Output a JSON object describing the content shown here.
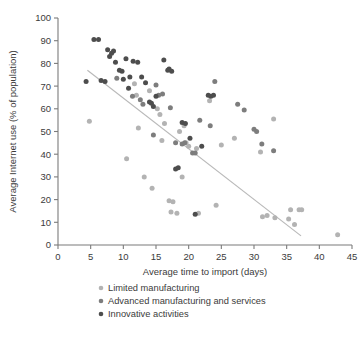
{
  "chart_data": {
    "type": "scatter",
    "title": "",
    "xlabel": "Average time to import (days)",
    "ylabel": "Average Internet use (% of population)",
    "xlim": [
      0,
      45
    ],
    "ylim": [
      0,
      100
    ],
    "xticks": [
      0,
      5,
      10,
      15,
      20,
      25,
      30,
      35,
      40,
      45
    ],
    "yticks": [
      0,
      10,
      20,
      30,
      40,
      50,
      60,
      70,
      80,
      90,
      100
    ],
    "grid": false,
    "legend_position": "below",
    "colors": {
      "limited_manufacturing": "#b3b3b3",
      "advanced_manufacturing": "#7d7d7d",
      "innovative_activities": "#4d4d4d",
      "trend_line": "#b9b9b9",
      "axis": "#7b7b7b",
      "text": "#3b3b3b"
    },
    "trend_line": {
      "x": [
        4.5,
        37.2
      ],
      "y": [
        77.0,
        4.0
      ]
    },
    "series": [
      {
        "name": "Limited manufacturing",
        "color": "#b3b3b3",
        "points": [
          [
            4.8,
            54.5
          ],
          [
            10.5,
            38.0
          ],
          [
            11.7,
            71.0
          ],
          [
            12.0,
            66.0
          ],
          [
            12.3,
            51.5
          ],
          [
            13.2,
            30.0
          ],
          [
            14.0,
            68.0
          ],
          [
            14.4,
            25.0
          ],
          [
            15.2,
            60.0
          ],
          [
            15.6,
            57.5
          ],
          [
            15.9,
            46.0
          ],
          [
            16.3,
            53.5
          ],
          [
            17.0,
            19.5
          ],
          [
            17.3,
            14.5
          ],
          [
            17.6,
            19.0
          ],
          [
            18.2,
            14.0
          ],
          [
            18.6,
            50.0
          ],
          [
            19.0,
            30.0
          ],
          [
            19.3,
            52.5
          ],
          [
            19.6,
            45.0
          ],
          [
            20.0,
            43.5
          ],
          [
            21.2,
            42.5
          ],
          [
            21.5,
            14.0
          ],
          [
            23.2,
            63.5
          ],
          [
            24.2,
            17.5
          ],
          [
            25.0,
            44.0
          ],
          [
            27.0,
            47.0
          ],
          [
            31.0,
            41.0
          ],
          [
            31.3,
            12.5
          ],
          [
            32.0,
            13.0
          ],
          [
            33.0,
            55.5
          ],
          [
            33.2,
            12.0
          ],
          [
            35.3,
            11.5
          ],
          [
            35.6,
            15.5
          ],
          [
            36.2,
            9.0
          ],
          [
            36.9,
            15.5
          ],
          [
            37.3,
            15.5
          ],
          [
            42.8,
            4.5
          ]
        ]
      },
      {
        "name": "Advanced manufacturing and services",
        "color": "#7d7d7d",
        "points": [
          [
            9.0,
            73.5
          ],
          [
            11.4,
            65.5
          ],
          [
            12.6,
            64.0
          ],
          [
            13.0,
            62.0
          ],
          [
            14.6,
            48.5
          ],
          [
            15.0,
            70.5
          ],
          [
            15.4,
            66.0
          ],
          [
            16.0,
            66.5
          ],
          [
            17.2,
            60.5
          ],
          [
            18.0,
            45.0
          ],
          [
            19.0,
            44.5
          ],
          [
            19.4,
            45.0
          ],
          [
            20.6,
            40.5
          ],
          [
            21.0,
            40.5
          ],
          [
            21.7,
            55.0
          ],
          [
            23.3,
            52.5
          ],
          [
            24.0,
            72.0
          ],
          [
            27.5,
            62.0
          ],
          [
            28.5,
            59.5
          ],
          [
            30.0,
            51.0
          ],
          [
            30.4,
            50.0
          ],
          [
            31.2,
            44.5
          ],
          [
            33.0,
            41.5
          ]
        ]
      },
      {
        "name": "Innovative activities",
        "color": "#4d4d4d",
        "points": [
          [
            4.3,
            72.0
          ],
          [
            5.5,
            90.5
          ],
          [
            6.2,
            90.5
          ],
          [
            6.6,
            72.5
          ],
          [
            7.2,
            72.0
          ],
          [
            7.6,
            86.0
          ],
          [
            7.9,
            83.0
          ],
          [
            8.2,
            84.5
          ],
          [
            8.5,
            85.5
          ],
          [
            8.8,
            80.5
          ],
          [
            9.4,
            77.0
          ],
          [
            9.8,
            76.5
          ],
          [
            10.0,
            73.0
          ],
          [
            10.4,
            82.0
          ],
          [
            10.8,
            69.0
          ],
          [
            11.0,
            74.0
          ],
          [
            11.5,
            81.0
          ],
          [
            12.2,
            80.5
          ],
          [
            12.8,
            74.0
          ],
          [
            13.4,
            71.5
          ],
          [
            14.0,
            63.0
          ],
          [
            14.3,
            62.5
          ],
          [
            14.6,
            61.0
          ],
          [
            15.0,
            65.5
          ],
          [
            16.2,
            81.5
          ],
          [
            16.8,
            77.0
          ],
          [
            17.0,
            77.5
          ],
          [
            17.4,
            76.5
          ],
          [
            18.0,
            33.5
          ],
          [
            18.4,
            34.0
          ],
          [
            19.0,
            54.0
          ],
          [
            19.5,
            53.5
          ],
          [
            20.2,
            47.0
          ],
          [
            21.0,
            13.5
          ],
          [
            22.0,
            43.5
          ],
          [
            23.0,
            66.0
          ],
          [
            23.4,
            65.5
          ],
          [
            23.8,
            66.0
          ]
        ]
      }
    ]
  },
  "legend": {
    "items": [
      {
        "label": "Limited manufacturing",
        "color": "#b3b3b3"
      },
      {
        "label": "Advanced manufacturing and services",
        "color": "#7d7d7d"
      },
      {
        "label": "Innovative activities",
        "color": "#4d4d4d"
      }
    ]
  }
}
